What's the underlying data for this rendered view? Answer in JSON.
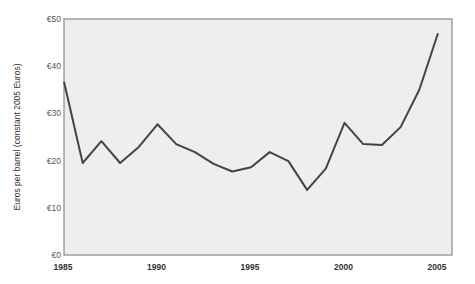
{
  "chart_data": {
    "type": "line",
    "title": "",
    "xlabel": "",
    "ylabel": "Euros per barrel (constant 2005 Euros)",
    "x": [
      1985,
      1986,
      1987,
      1988,
      1989,
      1990,
      1991,
      1992,
      1993,
      1994,
      1995,
      1996,
      1997,
      1998,
      1999,
      2000,
      2001,
      2002,
      2003,
      2004,
      2005
    ],
    "series": [
      {
        "name": "Oil price",
        "values": [
          36.7,
          19.5,
          24.1,
          19.5,
          22.9,
          27.7,
          23.5,
          21.8,
          19.3,
          17.7,
          18.6,
          21.8,
          19.9,
          13.8,
          18.3,
          28.0,
          23.5,
          23.3,
          27.1,
          35.0,
          47.0
        ]
      }
    ],
    "xlim": [
      1985,
      2006
    ],
    "ylim": [
      0,
      50
    ],
    "x_ticks": [
      1985,
      1990,
      1995,
      2000,
      2005
    ],
    "x_tick_labels": [
      "1985",
      "1990",
      "1995",
      "2000",
      "2005"
    ],
    "y_ticks": [
      0,
      10,
      20,
      30,
      40,
      50
    ],
    "y_tick_labels": [
      "€0",
      "€10",
      "€20",
      "€30",
      "€40",
      "€50"
    ],
    "grid": false,
    "legend": null,
    "colors": {
      "line": "#444444",
      "plot_background": "#eeeeee",
      "border": "#8a8a8a"
    }
  }
}
